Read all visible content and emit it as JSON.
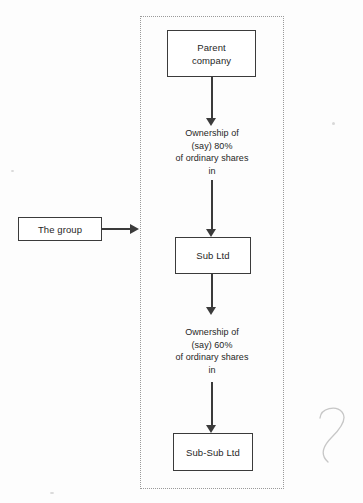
{
  "diagram": {
    "boundary_label": "group-boundary-dotted",
    "colors": {
      "box_border": "#3b3b3b",
      "boundary_border": "#9a9a9a",
      "text": "#1f1f1f",
      "background": "#ffffff"
    },
    "nodes": {
      "parent": {
        "line1": "Parent",
        "line2": "company"
      },
      "sub": {
        "label": "Sub Ltd"
      },
      "subsub": {
        "label": "Sub-Sub Ltd"
      },
      "group": {
        "label": "The group"
      }
    },
    "edges": {
      "parent_to_sub": {
        "line1": "Ownership of",
        "line2": "(say) 80%",
        "line3": "of ordinary shares",
        "line4": "in",
        "percent": "80%"
      },
      "sub_to_subsub": {
        "line1": "Ownership of",
        "line2": "(say) 60%",
        "line3": "of ordinary shares",
        "line4": "in",
        "percent": "60%"
      },
      "group_pointer": {
        "icon": "arrow-right-icon"
      }
    },
    "annotations": {
      "pencil_mark": "handwritten-curl-mark"
    }
  }
}
